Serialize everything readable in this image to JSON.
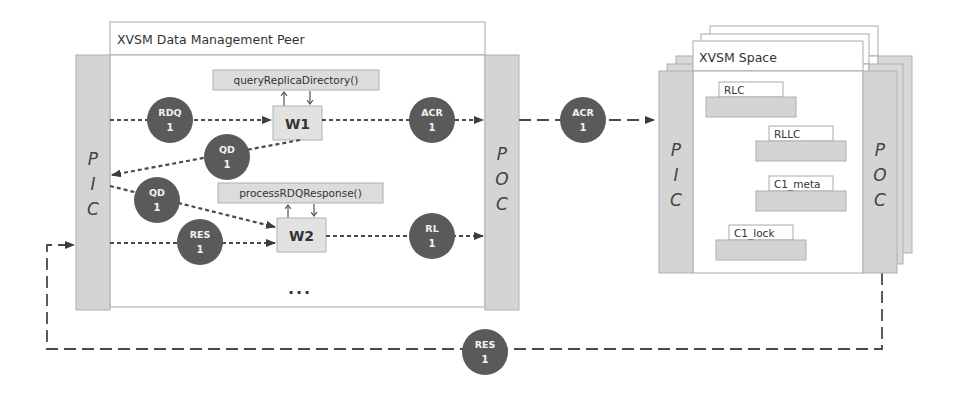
{
  "peer": {
    "title": "XVSM Data Management Peer",
    "pic_letters": [
      "P",
      "I",
      "C"
    ],
    "poc_letters": [
      "P",
      "O",
      "C"
    ],
    "workers": [
      {
        "id": "w1",
        "label": "W1",
        "function": "queryReplicaDirectory()"
      },
      {
        "id": "w2",
        "label": "W2",
        "function": "processRDQResponse()"
      }
    ],
    "ellipsis": "..."
  },
  "space": {
    "title": "XVSM Space",
    "pic_letters": [
      "P",
      "I",
      "C"
    ],
    "poc_letters": [
      "P",
      "O",
      "C"
    ],
    "containers": [
      {
        "label": "RLC"
      },
      {
        "label": "RLLC"
      },
      {
        "label": "C1_meta"
      },
      {
        "label": "C1_lock"
      }
    ]
  },
  "tokens": {
    "rdq_in": {
      "name": "RDQ",
      "count": "1"
    },
    "qd_out": {
      "name": "QD",
      "count": "1"
    },
    "qd_in": {
      "name": "QD",
      "count": "1"
    },
    "res_in": {
      "name": "RES",
      "count": "1"
    },
    "acr_out": {
      "name": "ACR",
      "count": "1"
    },
    "rl_out": {
      "name": "RL",
      "count": "1"
    },
    "acr_transfer": {
      "name": "ACR",
      "count": "1"
    },
    "res_return": {
      "name": "RES",
      "count": "1"
    }
  },
  "colors": {
    "token_fill": "#5a5a5a",
    "channel_fill": "#d4d4d4",
    "box_fill": "#dedede",
    "line": "#4a4a4a",
    "frame": "#9a9a9a"
  }
}
